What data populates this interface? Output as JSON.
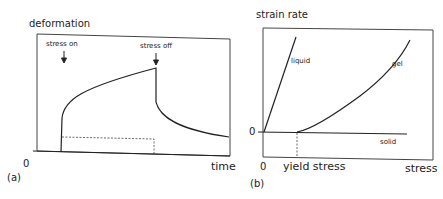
{
  "panel_a": {
    "tag": "(a)",
    "y_axis_label": "deformation",
    "x_axis_label": "time",
    "origin_label": "0",
    "annotations": {
      "stress_on": "stress on",
      "stress_off": "stress off"
    }
  },
  "panel_b": {
    "tag": "(b)",
    "y_axis_label": "strain rate",
    "x_axis_label": "stress",
    "x_origin_label": "0",
    "y_origin_label": "0",
    "yield_label": "yield stress",
    "curves": {
      "liquid": "liquid",
      "gel": "gel",
      "solid": "solid"
    }
  },
  "colors": {
    "line": "#222222",
    "frame": "#444444",
    "background": "#ffffff"
  }
}
